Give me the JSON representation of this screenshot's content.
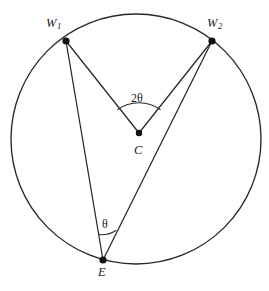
{
  "figure": {
    "type": "circle-geometry-diagram",
    "background_color": "#ffffff",
    "stroke_color": "#272727",
    "dot_color": "#111111"
  },
  "circle": {
    "name": "main-circle",
    "center_x": 136,
    "center_y": 139,
    "radius": 125
  },
  "points": {
    "w1": {
      "label": "W",
      "subscript": "1",
      "x": 66,
      "y": 41,
      "label_x": 46,
      "label_y": 17
    },
    "w2": {
      "label": "W",
      "subscript": "2",
      "x": 212,
      "y": 41,
      "label_x": 207,
      "label_y": 17
    },
    "c": {
      "label": "C",
      "x": 139,
      "y": 133,
      "label_x": 134,
      "label_y": 144
    },
    "e": {
      "label": "E",
      "x": 103,
      "y": 260,
      "label_x": 98,
      "label_y": 266
    }
  },
  "segments": [
    {
      "name": "radius-c-w1",
      "from": "c",
      "to": "w1"
    },
    {
      "name": "radius-c-w2",
      "from": "c",
      "to": "w2"
    },
    {
      "name": "chord-e-w1",
      "from": "e",
      "to": "w1"
    },
    {
      "name": "chord-e-w2",
      "from": "e",
      "to": "w2"
    }
  ],
  "angles": {
    "central": {
      "name": "central-angle",
      "label": "2θ",
      "vertex": "c",
      "label_x": 131,
      "label_y": 92
    },
    "inscribed": {
      "name": "inscribed-angle",
      "label": "θ",
      "vertex": "e",
      "label_x": 102,
      "label_y": 218
    }
  }
}
